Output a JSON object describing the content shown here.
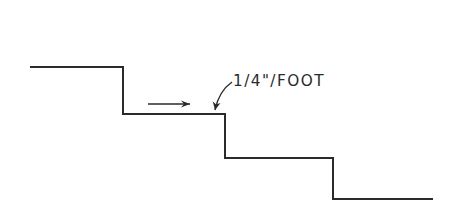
{
  "diagram": {
    "type": "stepped-profile",
    "label": "1/4\"/FOOT",
    "stroke_color": "#2b2b2b",
    "background_color": "#ffffff",
    "steps": [
      {
        "x1": 30,
        "x2": 123,
        "y": 67
      },
      {
        "x1": 123,
        "x2": 225,
        "y": 114
      },
      {
        "x1": 225,
        "x2": 333,
        "y": 158
      },
      {
        "x1": 333,
        "x2": 433,
        "y": 199
      }
    ],
    "direction_arrow": {
      "x1": 148,
      "x2": 190,
      "y": 104
    },
    "leader": {
      "from": [
        232,
        82
      ],
      "to": [
        214,
        112
      ]
    }
  }
}
